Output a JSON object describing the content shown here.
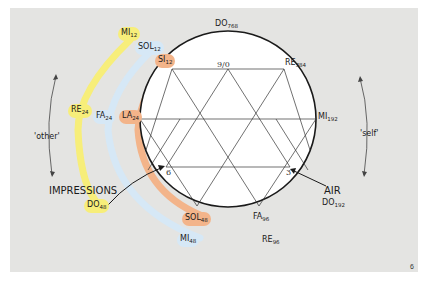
{
  "figure": {
    "page_number": "6",
    "side_labels": {
      "other": "'other'",
      "self": "'self'"
    },
    "callouts": {
      "impressions": "IMPRESSIONS",
      "air": "AIR"
    },
    "inner_points": {
      "top": "9/0",
      "left": "6",
      "right": "3"
    },
    "circle_notes": [
      {
        "note": "DO",
        "sub": "768"
      },
      {
        "note": "RE",
        "sub": "384"
      },
      {
        "note": "MI",
        "sub": "192"
      },
      {
        "note": "FA",
        "sub": "96"
      },
      {
        "note": "SOL",
        "sub": "48"
      },
      {
        "note": "LA",
        "sub": "24"
      },
      {
        "note": "SI",
        "sub": "12"
      }
    ],
    "air_octave": [
      {
        "note": "DO",
        "sub": "192"
      },
      {
        "note": "RE",
        "sub": "96"
      },
      {
        "note": "MI",
        "sub": "48"
      },
      {
        "note": "FA",
        "sub": "24"
      },
      {
        "note": "SOL",
        "sub": "12"
      }
    ],
    "impressions_octave": [
      {
        "note": "DO",
        "sub": "48"
      },
      {
        "note": "RE",
        "sub": "24"
      },
      {
        "note": "MI",
        "sub": "12"
      }
    ],
    "colors": {
      "panel": "#e4e4e2",
      "yellow_band": "#f7ee7a",
      "blue_band": "#d6e8f6",
      "orange_band": "#f3b48a",
      "line": "#1a1a1a"
    }
  }
}
